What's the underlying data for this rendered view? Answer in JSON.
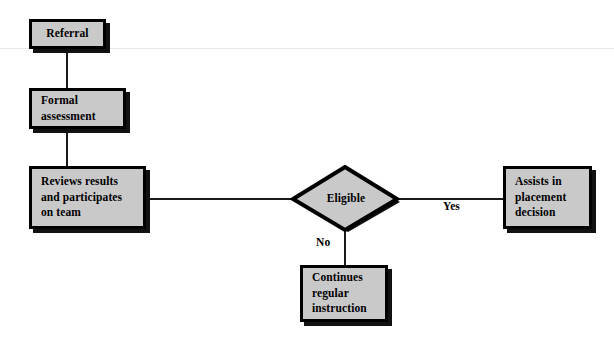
{
  "diagram": {
    "colors": {
      "node_fill": "#c9c9c9",
      "node_border": "#000000",
      "node_shadow": "#111111",
      "connector": "#1a1a1a",
      "page_rule": "#e9e9ec",
      "background": "#ffffff",
      "text": "#000000"
    },
    "nodes": {
      "referral": {
        "label": "Referral",
        "lines": [
          "Referral"
        ]
      },
      "formal_assessment": {
        "label": "Formal assessment",
        "lines": [
          "Formal",
          "assessment"
        ]
      },
      "reviews": {
        "label": "Reviews results and participates on team",
        "lines": [
          "Reviews results",
          "and participates",
          "on team"
        ]
      },
      "eligible": {
        "label": "Eligible",
        "shape": "diamond"
      },
      "continues": {
        "label": "Continues regular instruction",
        "lines": [
          "Continues",
          "regular",
          "instruction"
        ]
      },
      "assists": {
        "label": "Assists in placement decision",
        "lines": [
          "Assists in",
          "placement",
          "decision"
        ]
      }
    },
    "edge_labels": {
      "no": "No",
      "yes": "Yes"
    }
  }
}
